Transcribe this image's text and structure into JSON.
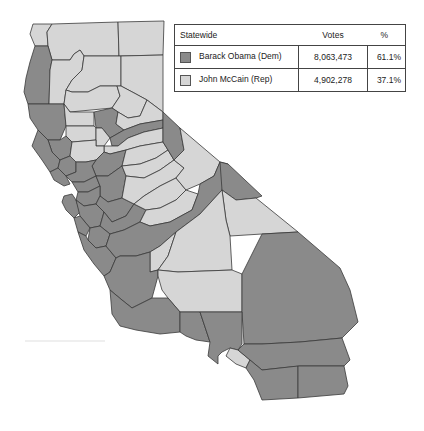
{
  "legend": {
    "header": {
      "label": "Statewide",
      "votes": "Votes",
      "pct": "%"
    },
    "rows": [
      {
        "candidate": "Barack Obama (Dem)",
        "votes": "8,063,473",
        "pct": "61.1%",
        "color": "#8a8a8a"
      },
      {
        "candidate": "John McCain (Rep)",
        "votes": "4,902,278",
        "pct": "37.1%",
        "color": "#d6d6d6"
      }
    ]
  },
  "map": {
    "region": "California",
    "colors": {
      "dem": "#8a8a8a",
      "rep": "#d6d6d6",
      "border": "#3a3a3a"
    }
  }
}
